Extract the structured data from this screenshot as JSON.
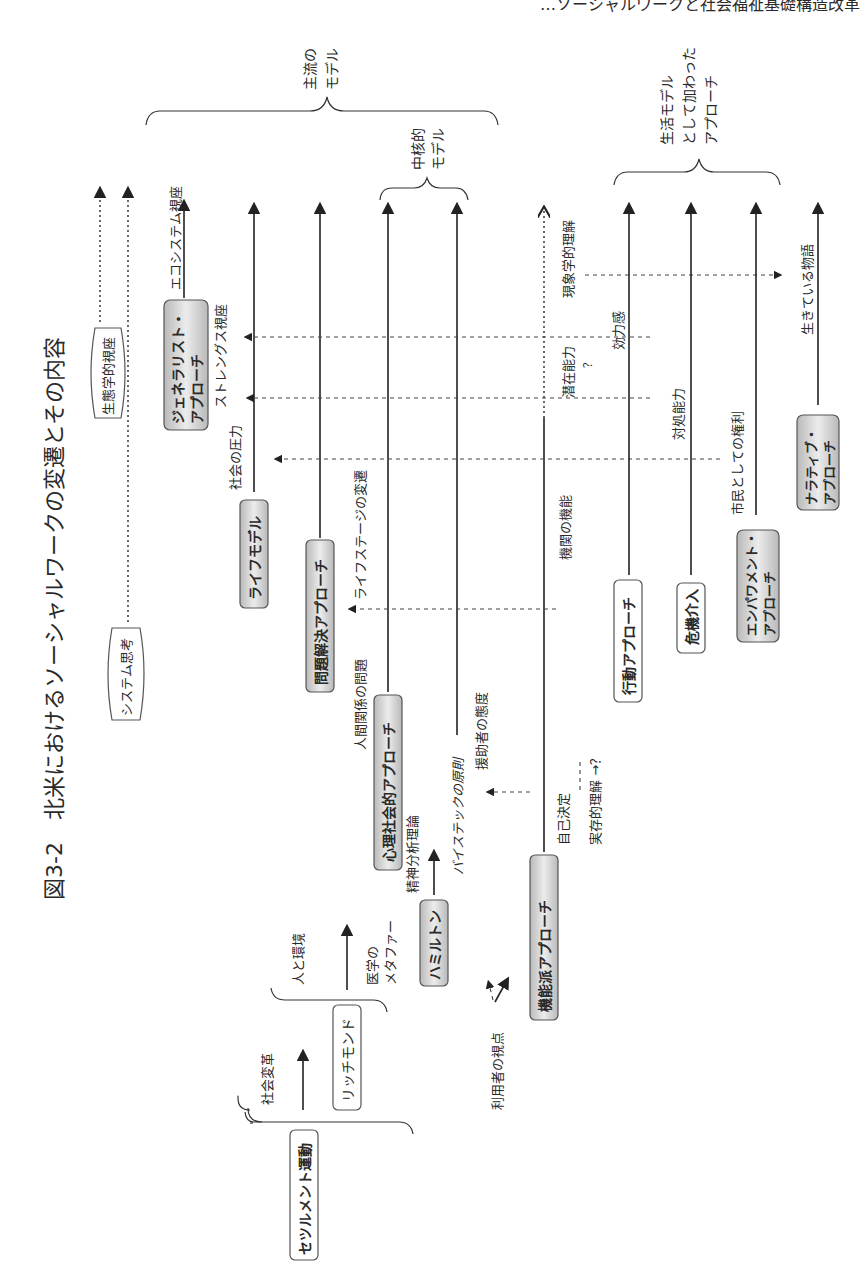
{
  "header": {
    "running_head": "…ソーシャルワークと社会福祉基礎構造改革",
    "figure_title": "図3-2　北米におけるソーシャルワークの変遷とその内容"
  },
  "braces": {
    "mainstream": "主流の\nモデル",
    "mainstream_l1": "主流の",
    "mainstream_l2": "モデル",
    "core_l1": "中核的",
    "core_l2": "モデル",
    "life_l1": "生活モデル",
    "life_l2": "として加わった",
    "life_l3": "アプローチ"
  },
  "thought_banners": {
    "ecological": "生態学的視座",
    "systems": "システム思考"
  },
  "models": {
    "settlement": "セツルメント運動",
    "richmond": "リッチモンド",
    "hamilton": "ハミルトン",
    "functional": "機能派アプローチ",
    "psychosocial": "心理社会的アプローチ",
    "problem_solving": "問題解決アプローチ",
    "life_model": "ライフモデル",
    "generalist_l1": "ジェネラリスト・",
    "generalist_l2": "アプローチ",
    "behavioral": "行動アプローチ",
    "crisis": "危機介入",
    "empowerment_l1": "エンパワメント・",
    "empowerment_l2": "アプローチ",
    "narrative_l1": "ナラティブ・",
    "narrative_l2": "アプローチ"
  },
  "labels": {
    "social_reform": "社会変革",
    "person_environment": "人と環境",
    "medical_metaphor_l1": "医学の",
    "medical_metaphor_l2": "メタファー",
    "user_perspective": "利用者の視点",
    "psychoanalysis": "精神分析理論",
    "biestek": "バイステックの原則",
    "helper_attitude": "援助者の態度",
    "self_determination": "自己決定",
    "existential": "実存的理解 →？",
    "agency_function": "機関の機能",
    "interpersonal": "人間関係の問題",
    "life_stage": "ライフステージの変遷",
    "social_pressure": "社会の圧力",
    "strengths": "ストレングス視座",
    "ecosystem": "エコシステム視座",
    "latent_ability": "潜在能力",
    "question": "？",
    "phenomenological": "現象学的理解",
    "efficacy": "効力感",
    "coping": "対処能力",
    "citizen_rights": "市民としての権利",
    "living_story": "生きている物語"
  }
}
